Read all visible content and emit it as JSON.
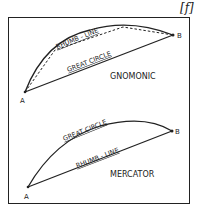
{
  "figure_label": "[f]",
  "panels": [
    {
      "name": "gnomonic",
      "title": "GNOMONIC",
      "point_a": "A",
      "point_b": "B",
      "curved_line_label": "RHUMB - LINE",
      "straight_line_label": "GREAT CIRCLE",
      "dashed_line": "approximating chord segments"
    },
    {
      "name": "mercator",
      "title": "MERCATOR",
      "point_a": "A",
      "point_b": "B",
      "curved_line_label": "GREAT CIRCLE",
      "straight_line_label": "RHUMB - LINE"
    }
  ],
  "colors": {
    "ink": "#222222",
    "background": "#ffffff"
  }
}
